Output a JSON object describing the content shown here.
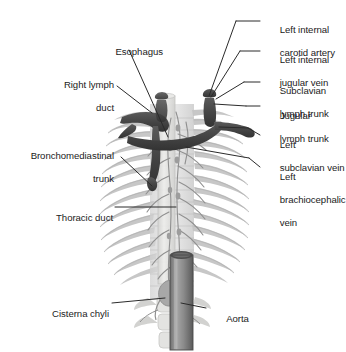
{
  "figure": {
    "type": "anatomical-illustration",
    "background_color": "#ffffff",
    "text_color": "#1b1b1b",
    "leader_line_color": "#2b2b2b"
  },
  "palette": {
    "lymph_trunk_dark": "#4a4a4a",
    "lymph_trunk_shadow": "#333333",
    "rib_gray": "#c9c9c9",
    "rib_gray_dark": "#b0b0b0",
    "vertebra_gray": "#d8d8d8",
    "esophagus_pale": "#e4e4e2",
    "aorta_gray": "#8d8d8d",
    "aorta_dark": "#5d5d5d",
    "vessel_gray": "#9a9a9a"
  },
  "labels_left": [
    {
      "id": "esophagus",
      "text": "Esophagus",
      "lines": [
        "Esophagus"
      ]
    },
    {
      "id": "right-lymph-duct",
      "text": "Right lymph duct",
      "lines": [
        "Right lymph",
        "duct"
      ]
    },
    {
      "id": "bronchomediastinal-trunk",
      "text": "Bronchomediastinal trunk",
      "lines": [
        "Bronchomediastinal",
        "trunk"
      ]
    },
    {
      "id": "thoracic-duct",
      "text": "Thoracic duct",
      "lines": [
        "Thoracic duct"
      ]
    },
    {
      "id": "cisterna-chyli",
      "text": "Cisterna chyli",
      "lines": [
        "Cisterna chyli"
      ]
    }
  ],
  "labels_right": [
    {
      "id": "left-internal-carotid-artery",
      "text": "Left internal carotid artery",
      "lines": [
        "Left internal",
        "carotid artery"
      ]
    },
    {
      "id": "left-internal-jugular-vein",
      "text": "Left internal jugular vein",
      "lines": [
        "Left internal",
        "jugular vein"
      ]
    },
    {
      "id": "subclavian-lymph-trunk",
      "text": "Subclavian lymph trunk",
      "lines": [
        "Subclavian",
        "lymph trunk"
      ]
    },
    {
      "id": "jugular-lymph-trunk",
      "text": "Jugular lymph trunk",
      "lines": [
        "Jugular",
        "lymph trunk"
      ]
    },
    {
      "id": "left-subclavian-vein",
      "text": "Left subclavian vein",
      "lines": [
        "Left",
        "subclavian vein"
      ]
    },
    {
      "id": "left-brachiocephalic-vein",
      "text": "Left brachiocephalic vein",
      "lines": [
        "Left",
        "brachiocephalic",
        "vein"
      ]
    }
  ],
  "labels_other": [
    {
      "id": "aorta",
      "text": "Aorta",
      "lines": [
        "Aorta"
      ]
    }
  ],
  "label_text": {
    "esophagus_1": "Esophagus",
    "right_lymph_duct_1": "Right lymph",
    "right_lymph_duct_2": "duct",
    "bronchomediastinal_1": "Bronchomediastinal",
    "bronchomediastinal_2": "trunk",
    "thoracic_duct_1": "Thoracic duct",
    "cisterna_chyli_1": "Cisterna chyli",
    "carotid_1": "Left internal",
    "carotid_2": "carotid artery",
    "jugular_vein_1": "Left internal",
    "jugular_vein_2": "jugular vein",
    "subclavian_trunk_1": "Subclavian",
    "subclavian_trunk_2": "lymph trunk",
    "jugular_trunk_1": "Jugular",
    "jugular_trunk_2": "lymph trunk",
    "subclavian_vein_1": "Left",
    "subclavian_vein_2": "subclavian vein",
    "brachiocephalic_1": "Left",
    "brachiocephalic_2": "brachiocephalic",
    "brachiocephalic_3": "vein",
    "aorta_1": "Aorta"
  }
}
